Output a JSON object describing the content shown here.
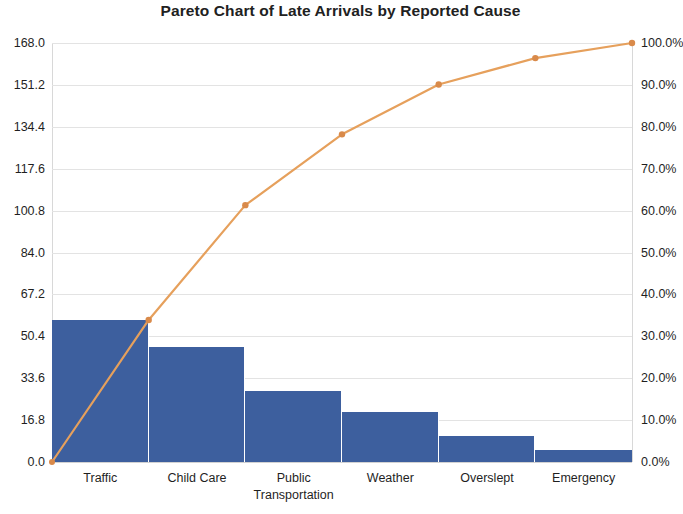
{
  "chart_data": {
    "type": "bar",
    "title": "Pareto Chart of Late Arrivals by Reported Cause",
    "xlabel": "",
    "ylabel": "",
    "categories": [
      "Traffic",
      "Child Care",
      "Public Transportation",
      "Weather",
      "Overslept",
      "Emergency"
    ],
    "series": [
      {
        "name": "Count",
        "type": "bar",
        "axis": "left",
        "values": [
          57,
          46,
          28.5,
          20,
          10.5,
          5
        ]
      },
      {
        "name": "Cumulative Percentage",
        "type": "line",
        "axis": "right",
        "values": [
          33.9,
          61.3,
          78.2,
          90.1,
          96.4,
          100.0
        ]
      }
    ],
    "ylim": [
      0,
      168
    ],
    "y2lim": [
      0,
      100
    ],
    "yticks": [
      "0.0",
      "16.8",
      "33.6",
      "50.4",
      "67.2",
      "84.0",
      "100.8",
      "117.6",
      "134.4",
      "151.2",
      "168.0"
    ],
    "ytick_values": [
      0,
      16.8,
      33.6,
      50.4,
      67.2,
      84.0,
      100.8,
      117.6,
      134.4,
      151.2,
      168.0
    ],
    "y2ticks": [
      "0.0%",
      "10.0%",
      "20.0%",
      "30.0%",
      "40.0%",
      "50.0%",
      "60.0%",
      "70.0%",
      "80.0%",
      "90.0%",
      "100.0%"
    ],
    "y2tick_values": [
      0,
      10,
      20,
      30,
      40,
      50,
      60,
      70,
      80,
      90,
      100
    ],
    "grid": true,
    "legend": false,
    "legend_position": "none",
    "bar_color": "#3d5f9e",
    "line_color": "#e6a05c",
    "marker_color": "#d98a4a",
    "background_color": "#ffffff",
    "gridline_color": "#e3e3e3"
  },
  "category_label_lines": [
    [
      "Traffic"
    ],
    [
      "Child Care"
    ],
    [
      "Public",
      "Transportation"
    ],
    [
      "Weather"
    ],
    [
      "Overslept"
    ],
    [
      "Emergency"
    ]
  ]
}
